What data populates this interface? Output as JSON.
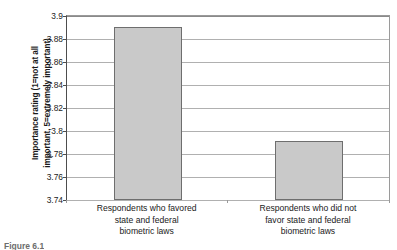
{
  "figure": {
    "caption": "Figure 6.1",
    "bar_fill_color": "#c9c9c9",
    "bar_border_color": "#6e6e6e",
    "axis_color": "#4d4d4d",
    "gridline_color": "#b0b0b0"
  },
  "axis": {
    "y_title_line1": "Importance rating (1=not at all",
    "y_title_line2": "important, 5=extremely important)"
  },
  "chart_data": {
    "type": "bar",
    "title": "",
    "xlabel": "",
    "ylabel": "Importance rating (1=not at all important, 5=extremely important)",
    "ylim": [
      3.74,
      3.9
    ],
    "ytick_values": [
      3.74,
      3.76,
      3.78,
      3.8,
      3.82,
      3.84,
      3.86,
      3.88,
      3.9
    ],
    "ytick_labels": [
      "3.74",
      "3.76",
      "3.78",
      "3.8",
      "3.82",
      "3.84",
      "3.86",
      "3.88",
      "3.9"
    ],
    "grid": true,
    "legend": false,
    "categories": [
      "Respondents who favored state and federal biometric laws",
      "Respondents who did not favor state and federal biometric laws"
    ],
    "category_label_lines": [
      [
        "Respondents who favored",
        "state and federal",
        "biometric laws"
      ],
      [
        "Respondents who did not",
        "favor state and federal",
        "biometric laws"
      ]
    ],
    "values": [
      3.891,
      3.791
    ]
  }
}
